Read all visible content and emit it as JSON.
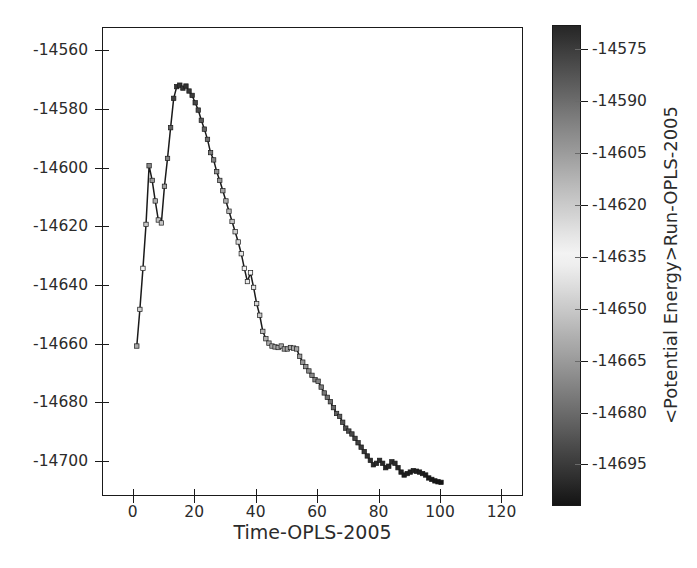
{
  "chart_data": {
    "type": "line",
    "title": "",
    "xlabel": "Time-OPLS-2005",
    "ylabel": "",
    "xlim": [
      -10,
      127
    ],
    "ylim": [
      -14712,
      -14552
    ],
    "xticks": [
      0,
      20,
      40,
      60,
      80,
      100,
      120
    ],
    "xticklabels": [
      "0",
      "20",
      "40",
      "60",
      "80",
      "100",
      "120"
    ],
    "yticks": [
      -14560,
      -14580,
      -14600,
      -14620,
      -14640,
      -14660,
      -14680,
      -14700
    ],
    "yticklabels": [
      "-14560",
      "-14580",
      "-14600",
      "-14620",
      "-14640",
      "-14660",
      "-14680",
      "-14700"
    ],
    "grid": false,
    "legend": null,
    "line_color": "#1a1a1a",
    "marker": "square",
    "x": [
      1,
      2,
      3,
      4,
      5,
      6,
      7,
      8,
      9,
      10,
      11,
      12,
      13,
      14,
      15,
      16,
      17,
      18,
      19,
      20,
      21,
      22,
      23,
      24,
      25,
      26,
      27,
      28,
      29,
      30,
      31,
      32,
      33,
      34,
      35,
      36,
      37,
      38,
      39,
      40,
      41,
      42,
      43,
      44,
      45,
      46,
      47,
      48,
      49,
      50,
      51,
      52,
      53,
      54,
      55,
      56,
      57,
      58,
      59,
      60,
      61,
      62,
      63,
      64,
      65,
      66,
      67,
      68,
      69,
      70,
      71,
      72,
      73,
      74,
      75,
      76,
      77,
      78,
      79,
      80,
      81,
      82,
      83,
      84,
      85,
      86,
      87,
      88,
      89,
      90,
      91,
      92,
      93,
      94,
      95,
      96,
      97,
      98,
      99,
      100
    ],
    "y": [
      -14660.5,
      -14648.0,
      -14634.0,
      -14619.0,
      -14599.0,
      -14604.0,
      -14611.0,
      -14617.5,
      -14618.5,
      -14606.0,
      -14596.5,
      -14586.0,
      -14576.0,
      -14572.0,
      -14571.5,
      -14572.5,
      -14571.8,
      -14573.5,
      -14575.0,
      -14577.5,
      -14580.0,
      -14583.5,
      -14586.5,
      -14590.0,
      -14594.5,
      -14597.0,
      -14601.0,
      -14604.0,
      -14607.5,
      -14611.0,
      -14614.5,
      -14618.0,
      -14621.5,
      -14625.0,
      -14629.0,
      -14634.0,
      -14638.5,
      -14635.5,
      -14640.5,
      -14646.0,
      -14650.0,
      -14655.5,
      -14658.0,
      -14659.5,
      -14660.5,
      -14660.8,
      -14661.0,
      -14660.5,
      -14661.5,
      -14661.5,
      -14661.0,
      -14661.2,
      -14661.5,
      -14664.0,
      -14666.0,
      -14667.5,
      -14669.0,
      -14670.5,
      -14672.0,
      -14672.5,
      -14674.5,
      -14676.5,
      -14678.0,
      -14679.5,
      -14681.5,
      -14683.5,
      -14684.5,
      -14686.5,
      -14688.5,
      -14689.5,
      -14690.5,
      -14692.0,
      -14693.5,
      -14695.0,
      -14696.5,
      -14698.0,
      -14699.5,
      -14701.0,
      -14700.5,
      -14699.5,
      -14700.5,
      -14702.0,
      -14701.5,
      -14700.0,
      -14700.5,
      -14702.0,
      -14703.5,
      -14704.5,
      -14704.0,
      -14703.5,
      -14703.0,
      -14703.2,
      -14703.5,
      -14704.0,
      -14704.5,
      -14705.5,
      -14706.0,
      -14706.5,
      -14706.8,
      -14707.0
    ]
  },
  "colorbar": {
    "label": "<Potential Energy>Run-OPLS-2005",
    "ticks": [
      -14575,
      -14590,
      -14605,
      -14620,
      -14635,
      -14650,
      -14665,
      -14680,
      -14695
    ],
    "ticklabels": [
      "-14575",
      "-14590",
      "-14605",
      "-14620",
      "-14635",
      "-14650",
      "-14665",
      "-14680",
      "-14695"
    ],
    "vmin": -14707,
    "vmax": -14568,
    "colormap": "binary-diverging-gray",
    "color_top": "#2a2a2a",
    "color_mid": "#f2f2f2",
    "color_bottom": "#141414"
  }
}
